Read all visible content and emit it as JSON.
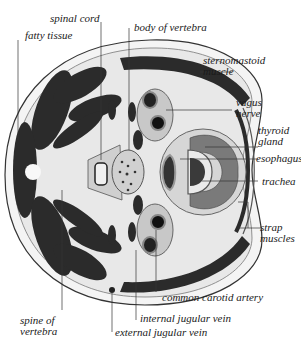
{
  "diagram": {
    "colors": {
      "background": "#ffffff",
      "skin": "#f2f2f2",
      "fat": "#e6e6e6",
      "muscle": "#2b2b2b",
      "muscle_light": "#6f6f6f",
      "fascia": "#bdbdbd",
      "line": "#333333",
      "thyroid": "#7a7a7a",
      "bone": "#d9d9d9",
      "text": "#1a1a1a"
    },
    "labels": {
      "spinal_cord": "spinal cord",
      "fatty_tissue": "fatty tissue",
      "body_of_vertebra": "body of vertebra",
      "sternomastoid_1": "sternomastoid",
      "sternomastoid_2": "muscle",
      "vagus_1": "vagus",
      "vagus_2": "nerve",
      "thyroid_1": "thyroid",
      "thyroid_2": "gland",
      "esophagus": "esophagus",
      "trachea": "trachea",
      "strap_1": "strap",
      "strap_2": "muscles",
      "common_carotid": "common carotid artery",
      "spine_1": "spine of",
      "spine_2": "vertebra",
      "internal_jugular": "internal jugular vein",
      "external_jugular": "external jugular vein"
    }
  }
}
